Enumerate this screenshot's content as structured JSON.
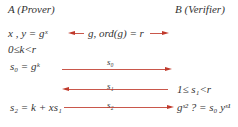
{
  "parties": {
    "prover": "A (Prover)",
    "verifier": "B (Verifier)"
  },
  "rows": {
    "setup_left": "x , y = gˣ",
    "public_params": "g, ord(g) = r",
    "k_range": "0≤k<r",
    "s0_def": "s₀ = gᵏ",
    "s0_label": "s₀",
    "s1_label": "s₁",
    "s1_range": "1≤ s₁<r",
    "s2_def": "s₂ = k + xs₁",
    "s2_label": "s₂",
    "verify": "gˢ² ? = s₀ yˢ¹"
  },
  "colors": {
    "arrow": "#c0392b",
    "text": "#333333"
  }
}
